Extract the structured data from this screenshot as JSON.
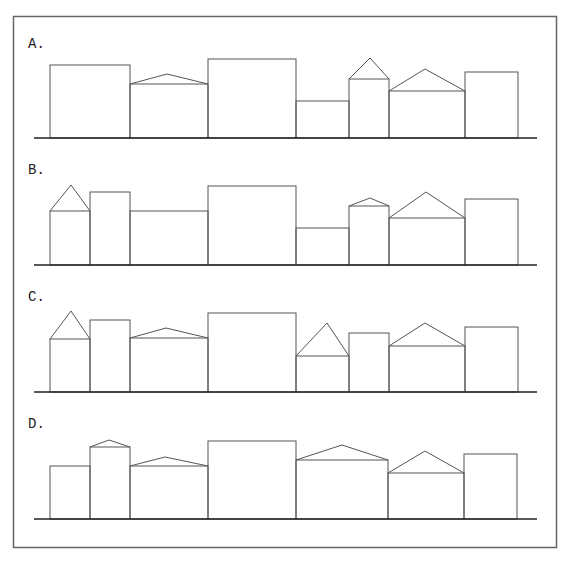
{
  "figure": {
    "line_color": "#555555",
    "ground_color": "#222222",
    "border_color": "#666666",
    "border": {
      "x": 13.5,
      "y": 16.5,
      "width": 543,
      "height": 531
    }
  },
  "options": [
    {
      "label": "A.",
      "label_pos": [
        28,
        48
      ],
      "ground": {
        "y": 138,
        "x1": 34,
        "x2": 537
      },
      "buildings": [
        {
          "x1": 50,
          "x2": 130,
          "top": 65
        },
        {
          "x1": 130,
          "x2": 208,
          "top": 84,
          "roof_peak": [
            167,
            74
          ]
        },
        {
          "x1": 208,
          "x2": 296,
          "top": 59
        },
        {
          "x1": 296,
          "x2": 349,
          "top": 101
        },
        {
          "x1": 349,
          "x2": 389,
          "top": 79,
          "roof_peak": [
            370,
            58
          ]
        },
        {
          "x1": 389,
          "x2": 465,
          "top": 91,
          "roof_peak": [
            425,
            69
          ]
        },
        {
          "x1": 465,
          "x2": 518,
          "top": 72
        }
      ]
    },
    {
      "label": "B.",
      "label_pos": [
        28,
        174
      ],
      "ground": {
        "y": 265,
        "x1": 34,
        "x2": 537
      },
      "buildings": [
        {
          "x1": 50,
          "x2": 90,
          "top": 211,
          "roof_peak": [
            71,
            185
          ]
        },
        {
          "x1": 90,
          "x2": 130,
          "top": 192
        },
        {
          "x1": 130,
          "x2": 208,
          "top": 211
        },
        {
          "x1": 208,
          "x2": 296,
          "top": 186
        },
        {
          "x1": 296,
          "x2": 349,
          "top": 228
        },
        {
          "x1": 349,
          "x2": 389,
          "top": 206,
          "roof_peak": [
            370,
            198
          ]
        },
        {
          "x1": 389,
          "x2": 465,
          "top": 218,
          "roof_peak": [
            426,
            192
          ]
        },
        {
          "x1": 465,
          "x2": 518,
          "top": 199
        }
      ]
    },
    {
      "label": "C.",
      "label_pos": [
        28,
        301
      ],
      "ground": {
        "y": 392,
        "x1": 34,
        "x2": 537
      },
      "buildings": [
        {
          "x1": 50,
          "x2": 90,
          "top": 339,
          "roof_peak": [
            71,
            311
          ]
        },
        {
          "x1": 90,
          "x2": 130,
          "top": 320
        },
        {
          "x1": 130,
          "x2": 208,
          "top": 338,
          "roof_peak": [
            166,
            328
          ]
        },
        {
          "x1": 208,
          "x2": 296,
          "top": 313
        },
        {
          "x1": 296,
          "x2": 349,
          "top": 356,
          "roof_peak": [
            327,
            323
          ]
        },
        {
          "x1": 349,
          "x2": 389,
          "top": 333
        },
        {
          "x1": 389,
          "x2": 465,
          "top": 346,
          "roof_peak": [
            425,
            323
          ]
        },
        {
          "x1": 465,
          "x2": 518,
          "top": 327
        }
      ]
    },
    {
      "label": "D.",
      "label_pos": [
        28,
        428
      ],
      "ground": {
        "y": 519,
        "x1": 34,
        "x2": 537
      },
      "buildings": [
        {
          "x1": 50,
          "x2": 90,
          "top": 466
        },
        {
          "x1": 90,
          "x2": 130,
          "top": 447,
          "roof_peak": [
            109,
            440
          ]
        },
        {
          "x1": 130,
          "x2": 208,
          "top": 466,
          "roof_peak": [
            165,
            457
          ]
        },
        {
          "x1": 208,
          "x2": 296,
          "top": 441
        },
        {
          "x1": 296,
          "x2": 388,
          "top": 460,
          "roof_peak": [
            342,
            445
          ]
        },
        {
          "x1": 388,
          "x2": 464,
          "top": 473,
          "roof_peak": [
            425,
            451
          ]
        },
        {
          "x1": 464,
          "x2": 517,
          "top": 454
        }
      ]
    }
  ]
}
